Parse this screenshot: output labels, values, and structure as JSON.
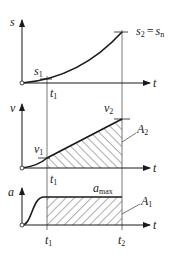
{
  "diagram": {
    "type": "kinematics-graphs",
    "colors": {
      "line": "#1a1a1a",
      "guide": "#555555",
      "hatch": "#333333",
      "background": "#ffffff"
    },
    "time_axis_label": "t",
    "time_marks": {
      "t1": "t",
      "t1_sub": "1",
      "t2": "t",
      "t2_sub": "2"
    },
    "panels": [
      {
        "id": "displacement",
        "y_axis_label": "s",
        "curve": "accelerating (parabolic) rise",
        "labels": {
          "s1": "s",
          "s1_sub": "1",
          "s2": "s",
          "s2_sub": "2",
          "eq": "=",
          "sn": "s",
          "sn_sub": "n"
        }
      },
      {
        "id": "velocity",
        "y_axis_label": "v",
        "curve": "smooth onset then linear rise",
        "labels": {
          "v1": "v",
          "v1_sub": "1",
          "v2": "v",
          "v2_sub": "2",
          "area": "A",
          "area_sub": "2"
        }
      },
      {
        "id": "acceleration",
        "y_axis_label": "a",
        "curve": "smooth ramp to constant maximum",
        "labels": {
          "amax": "a",
          "amax_sub": "max",
          "area": "A",
          "area_sub": "1"
        }
      }
    ]
  }
}
